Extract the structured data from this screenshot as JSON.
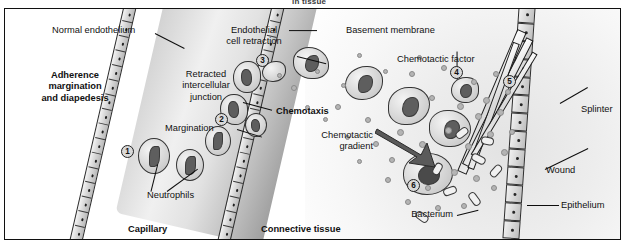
{
  "figure": {
    "running_head": "in tissue",
    "background_color": "#ffffff",
    "frame_color": "#101010"
  },
  "regions": {
    "capillary_label": "Capillary",
    "connective_label": "Connective tissue",
    "process_label": "Adherence\nmargination\nand diapedesis",
    "chemotaxis_label": "Chemotaxis"
  },
  "labels": {
    "normal_endothelium": "Normal endothelium",
    "endothelial_cell_retraction": "Endothelial\ncell retraction",
    "retracted_intercellular_junction": "Retracted\nintercellular\njunction",
    "margination": "Margination",
    "neutrophils": "Neutrophils",
    "basement_membrane": "Basement membrane",
    "chemotactic_factor": "Chemotactic factor",
    "chemotactic_gradient": "Chemotactic\ngradient",
    "splinter": "Splinter",
    "wound": "Wound",
    "bacterium": "Bacterium",
    "epithelium": "Epithelium"
  },
  "step_markers": [
    {
      "number": "1"
    },
    {
      "number": "2"
    },
    {
      "number": "3"
    },
    {
      "number": "4"
    },
    {
      "number": "5"
    },
    {
      "number": "6"
    }
  ],
  "colors": {
    "ink": "#111111",
    "lumen_light": "#f0f0f0",
    "lumen_dark": "#9e9e9e",
    "tissue": "#ededed",
    "cell_fill": "#dcdcdc",
    "nucleus": "#5e5e5e",
    "chemotactic_dot": "#b4b4b4"
  }
}
